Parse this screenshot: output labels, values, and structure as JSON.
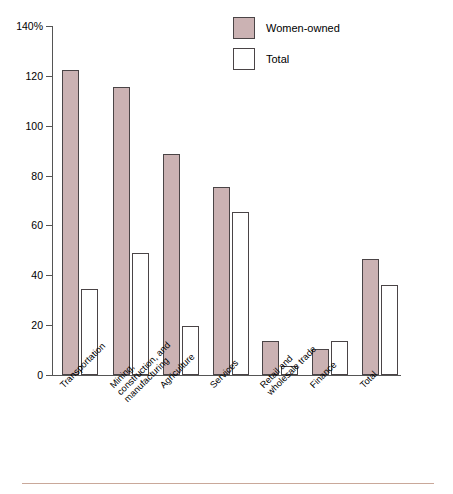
{
  "chart_data": {
    "type": "bar",
    "title": "",
    "subtitle": "",
    "xlabel": "",
    "ylabel": "",
    "ylim": [
      0,
      140
    ],
    "ytick_values": [
      0,
      20,
      40,
      60,
      80,
      100,
      120,
      140
    ],
    "ytick_labels": [
      "0",
      "20",
      "40",
      "60",
      "80",
      "100",
      "120",
      "140%"
    ],
    "grid": false,
    "legend_position": "top-center",
    "categories": [
      "Transportation",
      "Mining,\nconstruction, and\nmanufacturing",
      "Agriculture",
      "Services",
      "Retail and\nwholesale trade",
      "Finance",
      "Total"
    ],
    "series": [
      {
        "name": "Women-owned",
        "color": "#cbb2b3",
        "values": [
          122.5,
          115.5,
          88.5,
          75.5,
          13.7,
          10.5,
          46.5
        ]
      },
      {
        "name": "Total",
        "color": "#ffffff",
        "values": [
          34.4,
          48.8,
          19.5,
          65.2,
          3.5,
          13.5,
          36.3
        ]
      }
    ]
  },
  "legend": {
    "items": [
      {
        "label": "Women-owned",
        "swatch": "women"
      },
      {
        "label": "Total",
        "swatch": "total"
      }
    ]
  },
  "axis": {
    "y_max_label": "140%"
  },
  "colors": {
    "women_owned_fill": "#cbb2b3",
    "total_fill": "#ffffff",
    "bar_stroke": "#4a4446",
    "axis": "#555555",
    "rule": "#c9a89a"
  }
}
